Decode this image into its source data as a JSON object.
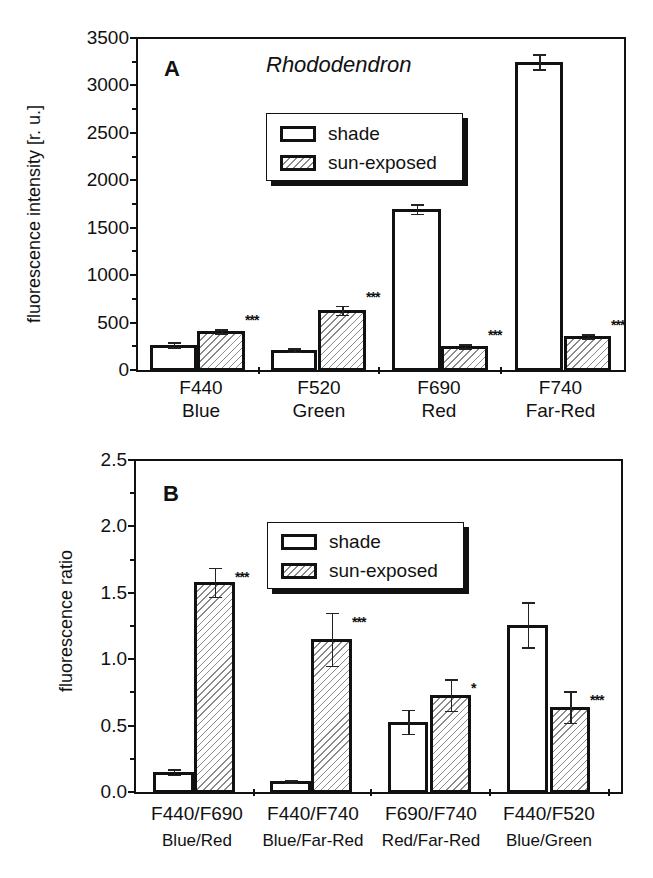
{
  "chart_data": [
    {
      "type": "bar",
      "panel": "A",
      "title": "Rhododendron",
      "xlabel": "",
      "ylabel": "fluorescence intensity [r. u.]",
      "ylim": [
        0,
        3500
      ],
      "yticks": [
        "0",
        "500",
        "1000",
        "1500",
        "2000",
        "2500",
        "3000",
        "3500"
      ],
      "categories": [
        "F440\nBlue",
        "F520\nGreen",
        "F690\nRed",
        "F740\nFar-Red"
      ],
      "category_lines": [
        [
          "F440",
          "Blue"
        ],
        [
          "F520",
          "Green"
        ],
        [
          "F690",
          "Red"
        ],
        [
          "F740",
          "Far-Red"
        ]
      ],
      "series": [
        {
          "name": "shade",
          "pattern": "open",
          "values": [
            265,
            210,
            1695,
            3250
          ],
          "errors": [
            25,
            20,
            50,
            80
          ]
        },
        {
          "name": "sun-exposed",
          "pattern": "hatched",
          "values": [
            410,
            630,
            250,
            355
          ],
          "errors": [
            20,
            45,
            20,
            20
          ]
        }
      ],
      "significance": [
        "***",
        "***",
        "***",
        "***"
      ],
      "legend": {
        "position": "upper-center",
        "entries": [
          "shade",
          "sun-exposed"
        ]
      },
      "grid": false
    },
    {
      "type": "bar",
      "panel": "B",
      "title": "",
      "xlabel": "",
      "ylabel": "fluorescence ratio",
      "ylim": [
        0,
        2.5
      ],
      "yticks": [
        "0.0",
        "0.5",
        "1.0",
        "1.5",
        "2.0",
        "2.5"
      ],
      "categories": [
        "F440/F690\nBlue/Red",
        "F440/F740\nBlue/Far-Red",
        "F690/F740\nRed/Far-Red",
        "F440/F520\nBlue/Green"
      ],
      "category_lines": [
        [
          "F440/F690",
          "Blue/Red"
        ],
        [
          "F440/F740",
          "Blue/Far-Red"
        ],
        [
          "F690/F740",
          "Red/Far-Red"
        ],
        [
          "F440/F520",
          "Blue/Green"
        ]
      ],
      "series": [
        {
          "name": "shade",
          "pattern": "open",
          "values": [
            0.15,
            0.08,
            0.53,
            1.26
          ],
          "errors": [
            0.02,
            0.01,
            0.09,
            0.17
          ]
        },
        {
          "name": "sun-exposed",
          "pattern": "hatched",
          "values": [
            1.58,
            1.15,
            0.73,
            0.64
          ],
          "errors": [
            0.11,
            0.2,
            0.12,
            0.12
          ]
        }
      ],
      "significance": [
        "***",
        "***",
        "*",
        "***"
      ],
      "legend": {
        "position": "upper-center",
        "entries": [
          "shade",
          "sun-exposed"
        ]
      },
      "grid": false
    }
  ],
  "panelA": {
    "letter": "A",
    "title": "Rhododendron",
    "ylabel": "fluorescence intensity [r. u.]",
    "yticks": [
      "0",
      "500",
      "1000",
      "1500",
      "2000",
      "2500",
      "3000",
      "3500"
    ],
    "legend": {
      "shade": "shade",
      "sun": "sun-exposed"
    },
    "cats": [
      {
        "l1": "F440",
        "l2": "Blue",
        "sig": "***"
      },
      {
        "l1": "F520",
        "l2": "Green",
        "sig": "***"
      },
      {
        "l1": "F690",
        "l2": "Red",
        "sig": "***"
      },
      {
        "l1": "F740",
        "l2": "Far-Red",
        "sig": "***"
      }
    ]
  },
  "panelB": {
    "letter": "B",
    "ylabel": "fluorescence ratio",
    "yticks": [
      "0.0",
      "0.5",
      "1.0",
      "1.5",
      "2.0",
      "2.5"
    ],
    "legend": {
      "shade": "shade",
      "sun": "sun-exposed"
    },
    "cats": [
      {
        "l1": "F440/F690",
        "l2": "Blue/Red",
        "sig": "***"
      },
      {
        "l1": "F440/F740",
        "l2": "Blue/Far-Red",
        "sig": "***"
      },
      {
        "l1": "F690/F740",
        "l2": "Red/Far-Red",
        "sig": "*"
      },
      {
        "l1": "F440/F520",
        "l2": "Blue/Green",
        "sig": "***"
      }
    ]
  }
}
